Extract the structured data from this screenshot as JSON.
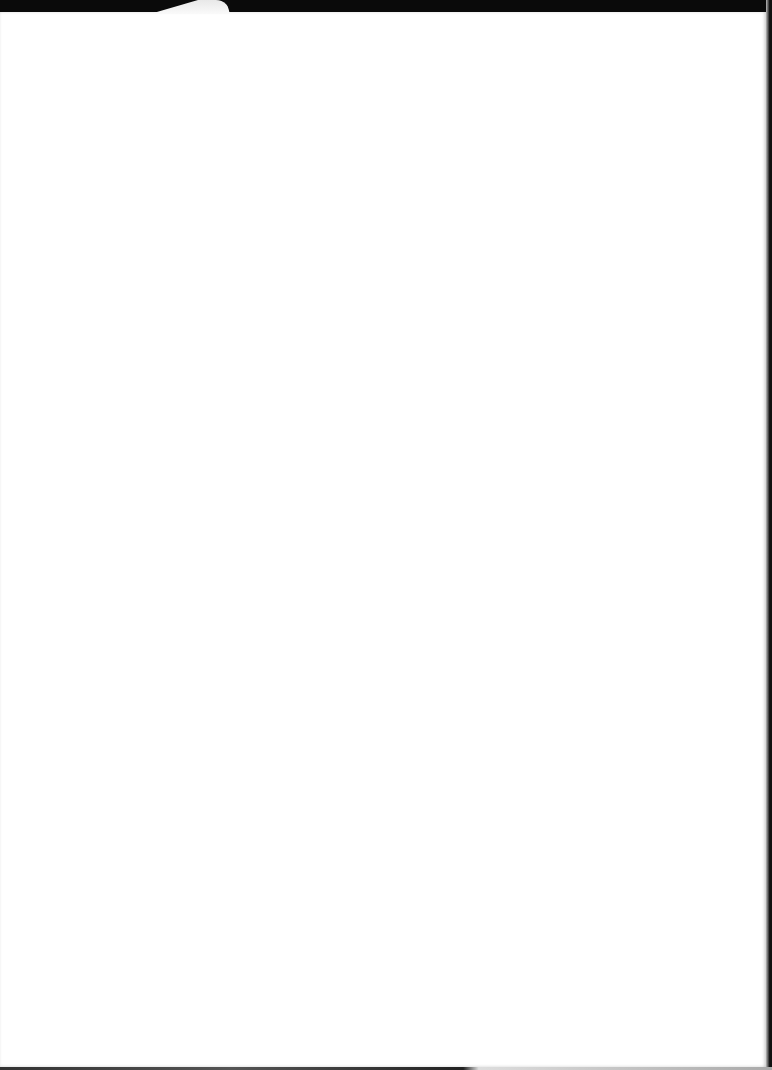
{
  "document": {
    "type": "scanned-page",
    "content": "",
    "blank": true
  },
  "colors": {
    "page": "#ffffff",
    "background": "#0a0a0a"
  }
}
